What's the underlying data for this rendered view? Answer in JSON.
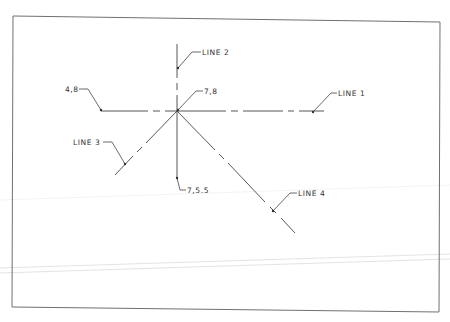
{
  "drawing": {
    "type": "CAD line sketch",
    "colors": {
      "ink": "#3a3a3a",
      "frame": "#707070",
      "faint": "#d4d4d4",
      "background": "#ffffff"
    },
    "frame": {
      "top_left": [
        13,
        16
      ],
      "top_right": [
        440,
        22
      ],
      "bottom_right": [
        439,
        312
      ],
      "bottom_left": [
        12,
        307
      ]
    },
    "labels": {
      "line1": "LINE 1",
      "line2": "LINE 2",
      "line3": "LINE 3",
      "line4": "LINE 4",
      "pt_4_8": "4,8",
      "pt_7_8": "7,8",
      "pt_7_5_5": "7,5.5"
    },
    "intersection_point": [
      177,
      111
    ]
  }
}
